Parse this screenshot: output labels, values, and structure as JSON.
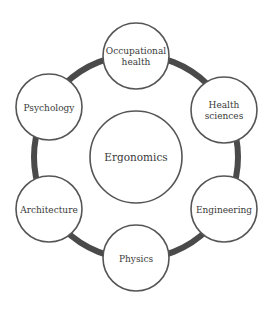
{
  "diagram": {
    "center": {
      "label": "Ergonomics",
      "cx": 136,
      "cy": 157,
      "r": 46
    },
    "ring": {
      "cx": 136,
      "cy": 157,
      "r": 102,
      "stroke": "#4a4a4a",
      "width": 6
    },
    "nodes": [
      {
        "id": "occupational-health",
        "lines": [
          "Occupational",
          "health"
        ],
        "cx": 136,
        "cy": 56,
        "r": 33
      },
      {
        "id": "health-sciences",
        "lines": [
          "Health",
          "sciences"
        ],
        "cx": 224,
        "cy": 110,
        "r": 33
      },
      {
        "id": "engineering",
        "lines": [
          "Engineering"
        ],
        "cx": 224,
        "cy": 209,
        "r": 33
      },
      {
        "id": "physics",
        "lines": [
          "Physics"
        ],
        "cx": 136,
        "cy": 258,
        "r": 33
      },
      {
        "id": "architecture",
        "lines": [
          "Architecture"
        ],
        "cx": 49,
        "cy": 209,
        "r": 33
      },
      {
        "id": "psychology",
        "lines": [
          "Psychology"
        ],
        "cx": 49,
        "cy": 107,
        "r": 33
      }
    ],
    "colors": {
      "circle_stroke": "#555555",
      "fill": "#ffffff",
      "text": "#3a3a3a"
    }
  }
}
